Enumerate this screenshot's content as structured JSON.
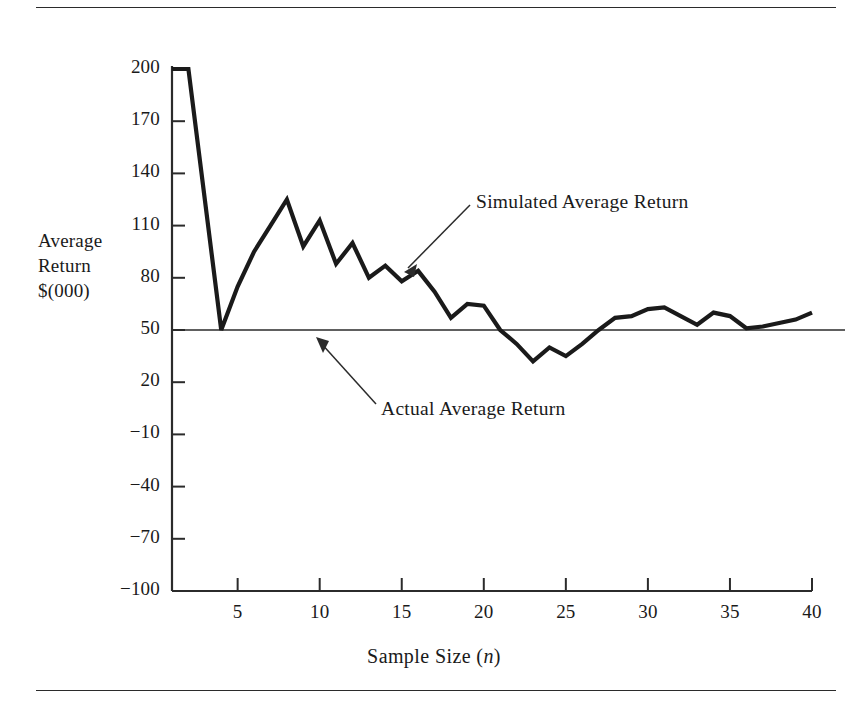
{
  "figure": {
    "axis_label_lines": [
      "Average",
      "Return",
      "$(000)"
    ],
    "x_axis_title_prefix": "Sample Size (",
    "x_axis_title_italic": "n",
    "x_axis_title_suffix": ")"
  },
  "annotations": [
    {
      "name": "simulated-average-return",
      "text": "Simulated Average Return"
    },
    {
      "name": "actual-average-return",
      "text": "Actual Average Return"
    }
  ],
  "chart_data": {
    "type": "line",
    "title": "",
    "xlabel": "Sample Size (n)",
    "ylabel": "Average Return $(000)",
    "xlim": [
      1,
      40
    ],
    "ylim": [
      -100,
      200
    ],
    "grid": false,
    "legend_position": "none",
    "xticks": [
      5,
      10,
      15,
      20,
      25,
      30,
      35,
      40
    ],
    "xtick_labels": [
      "5",
      "10",
      "15",
      "20",
      "25",
      "30",
      "35",
      "40"
    ],
    "yticks": [
      200,
      170,
      140,
      110,
      80,
      50,
      20,
      -10,
      -40,
      -70,
      -100
    ],
    "ytick_labels": [
      "200",
      "170",
      "140",
      "110",
      "80",
      "50",
      "20",
      "−10",
      "−40",
      "−70",
      "−100"
    ],
    "series": [
      {
        "name": "Simulated Average Return",
        "style": "thick-line",
        "color": "#1a1a1a",
        "x": [
          1,
          2,
          3,
          4,
          5,
          6,
          7,
          8,
          9,
          10,
          11,
          12,
          13,
          14,
          15,
          16,
          17,
          18,
          19,
          20,
          21,
          22,
          23,
          24,
          25,
          26,
          27,
          28,
          29,
          30,
          31,
          32,
          33,
          34,
          35,
          36,
          37,
          38,
          39,
          40
        ],
        "y": [
          200,
          200,
          125,
          50,
          75,
          95,
          110,
          125,
          98,
          113,
          88,
          100,
          80,
          87,
          78,
          84,
          72,
          57,
          65,
          64,
          50,
          42,
          32,
          40,
          35,
          42,
          50,
          57,
          58,
          62,
          63,
          58,
          53,
          60,
          58,
          51,
          52,
          54,
          56,
          60
        ]
      },
      {
        "name": "Actual Average Return",
        "style": "thin-line",
        "color": "#2b2b2b",
        "constant_y": 50,
        "x": [
          1,
          40
        ],
        "y": [
          50,
          50
        ]
      }
    ]
  }
}
